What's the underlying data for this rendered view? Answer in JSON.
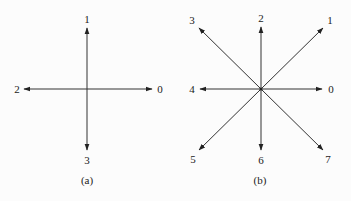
{
  "figure": {
    "line_color": "#333333",
    "background": "#fcfcfc",
    "panels": [
      {
        "caption": "(a)",
        "center": [
          87,
          89
        ],
        "directions": [
          {
            "label": "0",
            "tip": [
              152,
              89
            ],
            "label_pos": [
              160,
              93
            ]
          },
          {
            "label": "1",
            "tip": [
              87,
              28
            ],
            "label_pos": [
              87,
              23
            ]
          },
          {
            "label": "2",
            "tip": [
              24,
              89
            ],
            "label_pos": [
              17,
              93
            ]
          },
          {
            "label": "3",
            "tip": [
              87,
              150
            ],
            "label_pos": [
              87,
              164
            ]
          }
        ],
        "caption_pos": [
          87,
          184
        ]
      },
      {
        "caption": "(b)",
        "center": [
          261,
          89
        ],
        "directions": [
          {
            "label": "0",
            "tip": [
              322,
              89
            ],
            "label_pos": [
              331,
              93
            ]
          },
          {
            "label": "1",
            "tip": [
              323,
              28
            ],
            "label_pos": [
              330,
              24
            ]
          },
          {
            "label": "2",
            "tip": [
              261,
              27
            ],
            "label_pos": [
              261,
              22
            ]
          },
          {
            "label": "3",
            "tip": [
              199,
              28
            ],
            "label_pos": [
              192,
              24
            ]
          },
          {
            "label": "4",
            "tip": [
              200,
              89
            ],
            "label_pos": [
              192,
              93
            ]
          },
          {
            "label": "5",
            "tip": [
              199,
              150
            ],
            "label_pos": [
              193,
              163
            ]
          },
          {
            "label": "6",
            "tip": [
              261,
              150
            ],
            "label_pos": [
              261,
              164
            ]
          },
          {
            "label": "7",
            "tip": [
              323,
              150
            ],
            "label_pos": [
              328,
              163
            ]
          }
        ],
        "caption_pos": [
          260,
          184
        ]
      }
    ]
  }
}
